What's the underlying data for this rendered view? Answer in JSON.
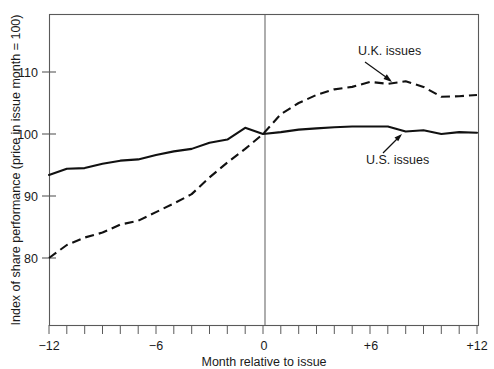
{
  "chart_data": {
    "type": "line",
    "title": "",
    "xlabel": "Month relative to issue",
    "ylabel": "Index of share performance (price in issue month = 100)",
    "xlim": [
      -12,
      12
    ],
    "ylim": [
      70.5,
      113.5
    ],
    "grid": false,
    "legend_position": "inline-annotations",
    "x_ticks": [
      -12,
      -11,
      -10,
      -9,
      -8,
      -7,
      -6,
      -5,
      -4,
      -3,
      -2,
      -1,
      0,
      1,
      2,
      3,
      4,
      5,
      6,
      7,
      8,
      9,
      10,
      11,
      12
    ],
    "x_tick_labels": [
      "−12",
      "−6",
      "0",
      "+6",
      "+12"
    ],
    "x_tick_label_values": [
      -12,
      -6,
      0,
      6,
      12
    ],
    "y_ticks": [
      80,
      90,
      100,
      110
    ],
    "y_tick_labels": [
      "80",
      "90",
      "100",
      "110"
    ],
    "reference_line_x": 0,
    "x": [
      -12,
      -11,
      -10,
      -9,
      -8,
      -7,
      -6,
      -5,
      -4,
      -3,
      -2,
      -1,
      0,
      1,
      2,
      3,
      4,
      5,
      6,
      7,
      8,
      9,
      10,
      11,
      12
    ],
    "series": [
      {
        "name": "U.K. issues",
        "style": "dashed",
        "color": "#111111",
        "values": [
          80.0,
          82.1,
          83.3,
          84.1,
          85.4,
          86.0,
          87.4,
          88.8,
          90.3,
          93.0,
          95.4,
          97.6,
          100.0,
          103.2,
          105.0,
          106.3,
          107.2,
          107.6,
          108.4,
          108.1,
          108.5,
          107.6,
          106.0,
          106.1,
          106.3
        ]
      },
      {
        "name": "U.S. issues",
        "style": "solid",
        "color": "#111111",
        "values": [
          93.4,
          94.4,
          94.5,
          95.2,
          95.7,
          95.9,
          96.6,
          97.2,
          97.6,
          98.6,
          99.1,
          101.0,
          100.0,
          100.3,
          100.7,
          100.9,
          101.1,
          101.2,
          101.2,
          101.2,
          100.4,
          100.6,
          100.0,
          100.3,
          100.2
        ]
      }
    ],
    "annotations": [
      {
        "text": "U.K. issues",
        "series": "U.K. issues"
      },
      {
        "text": "U.S. issues",
        "series": "U.S. issues"
      }
    ]
  },
  "axes": {
    "y_label": "Index of share performance (price in issue month = 100)",
    "x_label": "Month relative to issue",
    "y_tick_110": "110",
    "y_tick_100": "100",
    "y_tick_90": "90",
    "y_tick_80": "80",
    "x_tick_m12": "−12",
    "x_tick_m6": "−6",
    "x_tick_0": "0",
    "x_tick_p6": "+6",
    "x_tick_p12": "+12"
  },
  "annotations": {
    "uk_label": "U.K. issues",
    "us_label": "U.S. issues"
  },
  "colors": {
    "line": "#111111",
    "frame": "#5a5a5a",
    "background": "#ffffff",
    "text": "#1a1a1a"
  }
}
